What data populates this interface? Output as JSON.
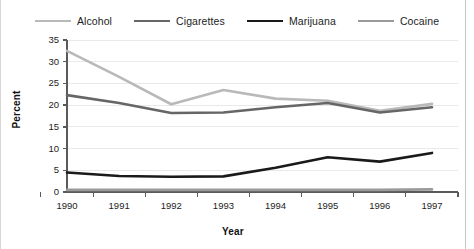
{
  "chart_data": {
    "type": "line",
    "title": "",
    "xlabel": "Year",
    "ylabel": "Percent",
    "categories": [
      "1990",
      "1991",
      "1992",
      "1993",
      "1994",
      "1995",
      "1996",
      "1997"
    ],
    "x": [
      1990,
      1991,
      1992,
      1993,
      1994,
      1995,
      1996,
      1997
    ],
    "xlim": [
      1990,
      1997
    ],
    "ylim": [
      0,
      35
    ],
    "yticks": [
      0,
      5,
      10,
      15,
      20,
      25,
      30,
      35
    ],
    "ytick_labels": [
      "0",
      "5",
      "10",
      "15",
      "20",
      "25",
      "30",
      "35"
    ],
    "grid": true,
    "grid_axis": "y",
    "legend_position": "top",
    "series": [
      {
        "name": "Alcohol",
        "color": "#b9b9b9",
        "width": 2.6,
        "values": [
          32.5,
          26.5,
          20.2,
          23.5,
          21.5,
          21.0,
          18.7,
          20.3
        ]
      },
      {
        "name": "Cigarettes",
        "color": "#666666",
        "width": 2.6,
        "values": [
          22.3,
          20.5,
          18.2,
          18.3,
          19.5,
          20.5,
          18.3,
          19.5
        ]
      },
      {
        "name": "Marijuana",
        "color": "#1a1a1a",
        "width": 2.6,
        "values": [
          4.5,
          3.7,
          3.5,
          3.6,
          5.6,
          8.0,
          7.0,
          9.0
        ]
      },
      {
        "name": "Cocaine",
        "color": "#9a9a9a",
        "width": 2.6,
        "values": [
          0.5,
          0.5,
          0.5,
          0.5,
          0.5,
          0.5,
          0.5,
          0.6
        ]
      }
    ]
  }
}
